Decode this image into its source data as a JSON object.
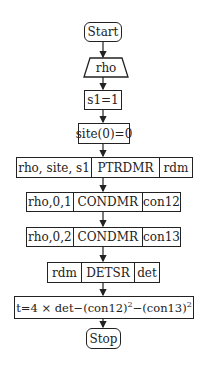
{
  "flowchart": {
    "start": "Start",
    "input": "rho",
    "step1": "s1=1",
    "step2": "site(0)=0",
    "ptrdmr": {
      "args": "rho, site, s1",
      "proc": "PTRDMR",
      "out": "rdm"
    },
    "condmr1": {
      "args": "rho,0,1",
      "proc": "CONDMR",
      "out": "con12"
    },
    "condmr2": {
      "args": "rho,0,2",
      "proc": "CONDMR",
      "out": "con13"
    },
    "detsr": {
      "args": "rdm",
      "proc": "DETSR",
      "out": "det"
    },
    "formula": {
      "lhs": "t=4 × det−(con12)",
      "exp1": "2",
      "mid": "−(con13)",
      "exp2": "2"
    },
    "stop": "Stop"
  },
  "colors": {
    "stroke": "#222222",
    "background": "#ffffff"
  }
}
